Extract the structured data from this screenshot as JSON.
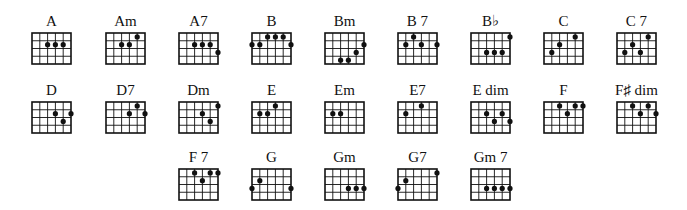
{
  "grid": {
    "strings": 6,
    "frets": 4
  },
  "colors": {
    "ink": "#111111",
    "background": "#ffffff"
  },
  "chords": [
    {
      "name": "A",
      "x": 32,
      "y": 33,
      "dots": [
        [
          3,
          2
        ],
        [
          4,
          2
        ],
        [
          5,
          2
        ]
      ]
    },
    {
      "name": "Am",
      "x": 106,
      "y": 33,
      "dots": [
        [
          3,
          2
        ],
        [
          4,
          2
        ],
        [
          5,
          1
        ]
      ]
    },
    {
      "name": "A7",
      "x": 179,
      "y": 33,
      "dots": [
        [
          3,
          2
        ],
        [
          4,
          2
        ],
        [
          5,
          2
        ],
        [
          6,
          3
        ]
      ]
    },
    {
      "name": "B",
      "x": 252,
      "y": 33,
      "dots": [
        [
          3,
          1
        ],
        [
          4,
          1
        ],
        [
          5,
          1
        ],
        [
          1,
          2
        ],
        [
          2,
          2
        ],
        [
          6,
          2
        ]
      ]
    },
    {
      "name": "Bm",
      "x": 325,
      "y": 33,
      "dots": [
        [
          6,
          2
        ],
        [
          5,
          3
        ],
        [
          3,
          4
        ],
        [
          4,
          4
        ]
      ]
    },
    {
      "name": "B 7",
      "x": 398,
      "y": 33,
      "dots": [
        [
          3,
          1
        ],
        [
          2,
          2
        ],
        [
          4,
          2
        ],
        [
          6,
          2
        ]
      ]
    },
    {
      "name": "B♭",
      "x": 471,
      "y": 33,
      "dots": [
        [
          6,
          1
        ],
        [
          3,
          3
        ],
        [
          4,
          3
        ],
        [
          5,
          3
        ]
      ]
    },
    {
      "name": "C",
      "x": 544,
      "y": 33,
      "dots": [
        [
          2,
          3
        ],
        [
          3,
          2
        ],
        [
          5,
          1
        ]
      ]
    },
    {
      "name": "C 7",
      "x": 617,
      "y": 33,
      "dots": [
        [
          2,
          3
        ],
        [
          3,
          2
        ],
        [
          4,
          3
        ],
        [
          5,
          1
        ]
      ]
    },
    {
      "name": "D",
      "x": 32,
      "y": 102,
      "dots": [
        [
          4,
          2
        ],
        [
          5,
          3
        ],
        [
          6,
          2
        ]
      ]
    },
    {
      "name": "D7",
      "x": 106,
      "y": 102,
      "dots": [
        [
          4,
          2
        ],
        [
          5,
          1
        ],
        [
          6,
          2
        ]
      ]
    },
    {
      "name": "Dm",
      "x": 179,
      "y": 102,
      "dots": [
        [
          4,
          2
        ],
        [
          5,
          3
        ],
        [
          6,
          1
        ]
      ]
    },
    {
      "name": "E",
      "x": 252,
      "y": 102,
      "dots": [
        [
          2,
          2
        ],
        [
          3,
          2
        ],
        [
          4,
          1
        ]
      ]
    },
    {
      "name": "Em",
      "x": 325,
      "y": 102,
      "dots": [
        [
          2,
          2
        ],
        [
          3,
          2
        ]
      ]
    },
    {
      "name": "E7",
      "x": 398,
      "y": 102,
      "dots": [
        [
          2,
          2
        ],
        [
          4,
          1
        ]
      ]
    },
    {
      "name": "E dim",
      "x": 471,
      "y": 102,
      "dots": [
        [
          3,
          2
        ],
        [
          4,
          3
        ],
        [
          5,
          2
        ],
        [
          6,
          3
        ]
      ]
    },
    {
      "name": "F",
      "x": 544,
      "y": 102,
      "dots": [
        [
          3,
          1
        ],
        [
          4,
          2
        ],
        [
          5,
          1
        ],
        [
          6,
          1
        ]
      ]
    },
    {
      "name": "F♯ dim",
      "x": 617,
      "y": 102,
      "dots": [
        [
          3,
          1
        ],
        [
          4,
          2
        ],
        [
          5,
          1
        ],
        [
          6,
          2
        ]
      ]
    },
    {
      "name": "F 7",
      "x": 179,
      "y": 169,
      "dots": [
        [
          3,
          1
        ],
        [
          4,
          2
        ],
        [
          5,
          1
        ],
        [
          6,
          1
        ]
      ]
    },
    {
      "name": "G",
      "x": 252,
      "y": 169,
      "dots": [
        [
          1,
          3
        ],
        [
          2,
          2
        ],
        [
          6,
          3
        ]
      ]
    },
    {
      "name": "Gm",
      "x": 325,
      "y": 169,
      "dots": [
        [
          4,
          3
        ],
        [
          5,
          3
        ],
        [
          6,
          3
        ]
      ]
    },
    {
      "name": "G7",
      "x": 398,
      "y": 169,
      "dots": [
        [
          1,
          3
        ],
        [
          2,
          2
        ],
        [
          6,
          1
        ]
      ]
    },
    {
      "name": "Gm 7",
      "x": 471,
      "y": 169,
      "dots": [
        [
          3,
          3
        ],
        [
          4,
          3
        ],
        [
          5,
          3
        ],
        [
          6,
          3
        ]
      ]
    }
  ]
}
